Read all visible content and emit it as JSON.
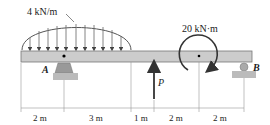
{
  "diagram": {
    "type": "beam-free-body",
    "distributed_load": {
      "label": "4 kN/m",
      "shape": "parabolic"
    },
    "moment": {
      "label": "20 kN·m",
      "direction": "clockwise"
    },
    "point_force": {
      "label": "P",
      "direction": "up"
    },
    "supports": [
      {
        "label": "A",
        "type": "pin"
      },
      {
        "label": "B",
        "type": "roller"
      }
    ],
    "dimensions": [
      "2 m",
      "3 m",
      "1 m",
      "2 m",
      "2 m"
    ]
  }
}
